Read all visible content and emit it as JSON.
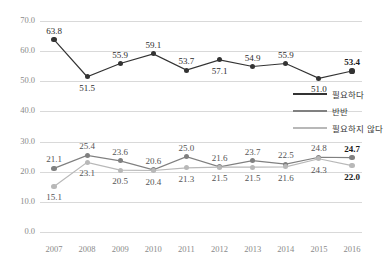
{
  "chart_data": {
    "type": "line",
    "title": "",
    "xlabel": "",
    "ylabel": "",
    "categories": [
      "2007",
      "2008",
      "2009",
      "2010",
      "2011",
      "2012",
      "2013",
      "2014",
      "2015",
      "2016"
    ],
    "ylim": [
      0.0,
      70.0
    ],
    "ytick_step": 10.0,
    "yticks": [
      "0.0",
      "10.0",
      "20.0",
      "30.0",
      "40.0",
      "50.0",
      "60.0",
      "70.0"
    ],
    "grid": true,
    "legend_position": "center-right",
    "series": [
      {
        "name": "필요하다",
        "color": "#333333",
        "values": [
          63.8,
          51.5,
          55.9,
          59.1,
          53.7,
          57.1,
          54.9,
          55.9,
          51.0,
          53.4
        ],
        "labels": [
          "63.8",
          "51.5",
          "55.9",
          "59.1",
          "53.7",
          "57.1",
          "54.9",
          "55.9",
          "51.0",
          "53.4"
        ],
        "label_positions": [
          "above",
          "below",
          "above",
          "above",
          "above",
          "below",
          "above",
          "above",
          "below",
          "above"
        ],
        "bold_labels": [
          false,
          false,
          false,
          false,
          false,
          false,
          false,
          false,
          false,
          true
        ]
      },
      {
        "name": "반반",
        "color": "#808080",
        "values": [
          21.1,
          25.4,
          23.6,
          20.6,
          25.0,
          21.6,
          23.7,
          22.5,
          24.8,
          24.7
        ],
        "labels": [
          "21.1",
          "25.4",
          "23.6",
          "20.6",
          "25.0",
          "21.6",
          "23.7",
          "22.5",
          "24.8",
          "24.7"
        ],
        "label_positions": [
          "above",
          "above",
          "above",
          "above",
          "above",
          "above",
          "above",
          "above",
          "above",
          "above"
        ],
        "bold_labels": [
          false,
          false,
          false,
          false,
          false,
          false,
          false,
          false,
          false,
          true
        ]
      },
      {
        "name": "필요하지 않다",
        "color": "#b8b8b8",
        "values": [
          15.1,
          23.1,
          20.5,
          20.4,
          21.3,
          21.5,
          21.5,
          21.6,
          24.3,
          22.0
        ],
        "labels": [
          "15.1",
          "23.1",
          "20.5",
          "20.4",
          "21.3",
          "21.5",
          "21.5",
          "21.6",
          "24.3",
          "22.0"
        ],
        "label_positions": [
          "below",
          "below",
          "below",
          "below",
          "below",
          "below",
          "below",
          "below",
          "below",
          "below"
        ],
        "bold_labels": [
          false,
          false,
          false,
          false,
          false,
          false,
          false,
          false,
          false,
          true
        ]
      }
    ]
  },
  "legend": {
    "items": [
      {
        "label": "필요하다",
        "color": "#333333"
      },
      {
        "label": "반반",
        "color": "#808080"
      },
      {
        "label": "필요하지 않다",
        "color": "#b8b8b8"
      }
    ]
  }
}
